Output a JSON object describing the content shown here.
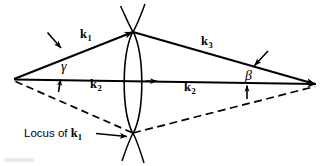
{
  "figure": {
    "type": "vector-diagram",
    "background_color": "#ffffff",
    "stroke_color": "#000000",
    "labels": {
      "k1": {
        "base": "k",
        "sub": "1",
        "x": 80,
        "y": 29
      },
      "k3": {
        "base": "k",
        "sub": "3",
        "x": 201,
        "y": 36
      },
      "k2_left": {
        "base": "k",
        "sub": "2",
        "x": 90,
        "y": 79
      },
      "k2_right": {
        "base": "k",
        "sub": "2",
        "x": 184,
        "y": 81
      },
      "gamma": {
        "text": "γ",
        "x": 61,
        "y": 61
      },
      "beta": {
        "text": "β",
        "x": 245,
        "y": 70
      },
      "locus": {
        "prefix": "Locus of ",
        "base": "k",
        "sub": "1",
        "x": 24,
        "y": 133
      }
    },
    "geometry": {
      "left_vertex": {
        "x": 14,
        "y": 79
      },
      "right_vertex": {
        "x": 316,
        "y": 84
      },
      "top_vertex": {
        "x": 133,
        "y": 32
      },
      "bottom_vertex": {
        "x": 133,
        "y": 133
      },
      "lens_center_x": 133,
      "lens_half_width": 12
    },
    "annotations": [
      "arrow pointing to k1 line from upper-left",
      "arrow pointing to k3 line from upper-right",
      "arrow pointing up to gamma angle",
      "arrow pointing up to beta angle",
      "arrow from Locus caption to lower lens cusp",
      "arrowhead mid horizontal k2 axis",
      "arrowhead at right vertex on k2 axis"
    ]
  }
}
